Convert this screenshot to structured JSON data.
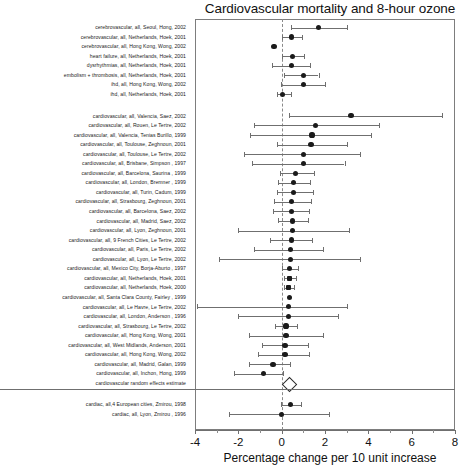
{
  "chart_data": {
    "type": "scatter",
    "title": "Cardiovascular mortality and 8-hour ozone",
    "xlabel": "Percentage change per 10 unit increase",
    "ylabel": "",
    "xlim": [
      -4,
      8
    ],
    "xticks": [
      -4,
      -2,
      0,
      2,
      4,
      6,
      8
    ],
    "xtick_labels": [
      "-4",
      "-2",
      "0",
      "2",
      "4",
      "6",
      "8"
    ],
    "grid": false,
    "reference_line": 0,
    "legend": "none",
    "annotations": [
      "Dashed vertical reference line at 0",
      "Open diamond marks the cardiovascular random effects estimate",
      "Horizontal lines are 95% confidence intervals with end caps"
    ],
    "groups": [
      {
        "name": "cerebrovascular / cardiac-specific outcomes",
        "rows": [
          {
            "label": "cerebrovascular, all, Seoul, Hong, 2002",
            "estimate": 1.7,
            "ci_low": 0.45,
            "ci_high": 3.0,
            "marker": "circle"
          },
          {
            "label": "cerebrovascular, all, Netherlands, Hoek, 2001",
            "estimate": 0.45,
            "ci_low": 0.0,
            "ci_high": 0.95,
            "marker": "circle"
          },
          {
            "label": "cerebrovascular, all, Hong Kong, Wong, 2002",
            "estimate": -0.35,
            "ci_low": -0.35,
            "ci_high": -0.35,
            "marker": "circle"
          },
          {
            "label": "heart failure, all, Netherlands, Hoek, 2001",
            "estimate": 0.5,
            "ci_low": 0.0,
            "ci_high": 1.05,
            "marker": "circle"
          },
          {
            "label": "dysrhythmias, all, Netherlands, Hoek, 2001",
            "estimate": 0.45,
            "ci_low": -0.45,
            "ci_high": 1.3,
            "marker": "circle"
          },
          {
            "label": "embolism + thrombosis, all, Netherlands, Hoek, 2001",
            "estimate": 1.0,
            "ci_low": 0.1,
            "ci_high": 1.7,
            "marker": "circle"
          },
          {
            "label": "ihd, all, Hong Kong, Wong, 2002",
            "estimate": 1.0,
            "ci_low": -0.05,
            "ci_high": 2.0,
            "marker": "circle"
          },
          {
            "label": "ihd, all, Netherlands, Hoek, 2001",
            "estimate": 0.05,
            "ci_low": -0.2,
            "ci_high": 0.45,
            "marker": "circle"
          }
        ]
      },
      {
        "name": "cardiovascular, all",
        "rows": [
          {
            "label": "cardiovascular, all, Valencia, Saez, 2002",
            "estimate": 3.2,
            "ci_low": 0.35,
            "ci_high": 7.4,
            "marker": "circle"
          },
          {
            "label": "cardiovascular, all, Rouen, Le Tertre, 2002",
            "estimate": 1.55,
            "ci_low": -1.3,
            "ci_high": 4.5,
            "marker": "circle"
          },
          {
            "label": "cardiovascular, all, Valencia, Tenias Burillo, 1999",
            "estimate": 1.4,
            "ci_low": -1.45,
            "ci_high": 4.1,
            "marker": "circle"
          },
          {
            "label": "cardiovascular, all, Toulouse, Zeghnoun, 2001",
            "estimate": 1.35,
            "ci_low": -0.2,
            "ci_high": 3.0,
            "marker": "circle"
          },
          {
            "label": "cardiovascular, all, Toulouse, Le Tertre, 2002",
            "estimate": 1.0,
            "ci_low": -1.75,
            "ci_high": 3.6,
            "marker": "circle"
          },
          {
            "label": "cardiovascular, all, Brisbane, Simpson , 1997",
            "estimate": 1.0,
            "ci_low": -1.35,
            "ci_high": 2.9,
            "marker": "circle"
          },
          {
            "label": "cardiovascular, all, Barcelona, Saurina , 1999",
            "estimate": 0.65,
            "ci_low": -0.1,
            "ci_high": 1.5,
            "marker": "circle"
          },
          {
            "label": "cardiovascular, all, London, Bremner , 1999",
            "estimate": 0.55,
            "ci_low": -0.15,
            "ci_high": 1.3,
            "marker": "circle"
          },
          {
            "label": "cardiovascular, all, Turin, Cadum, 1999",
            "estimate": 0.55,
            "ci_low": -0.2,
            "ci_high": 1.45,
            "marker": "circle"
          },
          {
            "label": "cardiovascular, all, Strasbourg, Zeghnoun, 2001",
            "estimate": 0.45,
            "ci_low": -0.35,
            "ci_high": 1.35,
            "marker": "circle"
          },
          {
            "label": "cardiovascular, all, Barcelona, Saez, 2002",
            "estimate": 0.45,
            "ci_low": -0.4,
            "ci_high": 1.25,
            "marker": "circle"
          },
          {
            "label": "cardiovascular, all, Madrid, Saez, 2002",
            "estimate": 0.5,
            "ci_low": -0.15,
            "ci_high": 1.2,
            "marker": "circle"
          },
          {
            "label": "cardiovascular, all, Lyon, Zeghnoun, 2001",
            "estimate": 0.5,
            "ci_low": -2.0,
            "ci_high": 3.1,
            "marker": "circle"
          },
          {
            "label": "cardiovascular, all, 9 French Cities, Le Tertre, 2002",
            "estimate": 0.45,
            "ci_low": -0.55,
            "ci_high": 1.4,
            "marker": "circle"
          },
          {
            "label": "cardiovascular, all, Paris, Le Tertre, 2002",
            "estimate": 0.4,
            "ci_low": -1.3,
            "ci_high": 1.9,
            "marker": "circle"
          },
          {
            "label": "cardiovascular, all, Lyon, Le Tertre, 2002",
            "estimate": 0.4,
            "ci_low": -2.9,
            "ci_high": 3.6,
            "marker": "circle"
          },
          {
            "label": "cardiovascular, all, Mexico City, Borja-Aburto , 1997",
            "estimate": 0.35,
            "ci_low": 0.0,
            "ci_high": 0.75,
            "marker": "circle"
          },
          {
            "label": "cardiovascular, all, Netherlands, Hoek, 2001",
            "estimate": 0.35,
            "ci_low": 0.1,
            "ci_high": 0.65,
            "marker": "square"
          },
          {
            "label": "cardiovascular, all, Netherlands, Hoek, 2000",
            "estimate": 0.3,
            "ci_low": 0.1,
            "ci_high": 0.55,
            "marker": "square"
          },
          {
            "label": "cardiovascular, all, Santa Clara County, Fairley , 1999",
            "estimate": 0.35,
            "ci_low": 0.35,
            "ci_high": 0.35,
            "marker": "circle"
          },
          {
            "label": "cardiovascular, all, Le Havre, Le Tertre, 2002",
            "estimate": 0.3,
            "ci_low": -3.9,
            "ci_high": 3.0,
            "marker": "circle"
          },
          {
            "label": "cardiovascular, all, London, Anderson , 1996",
            "estimate": 0.3,
            "ci_low": -2.0,
            "ci_high": 2.6,
            "marker": "circle"
          },
          {
            "label": "cardiovascular, all, Strasbourg, Le Tertre, 2002",
            "estimate": 0.2,
            "ci_low": -0.3,
            "ci_high": 0.7,
            "marker": "circle"
          },
          {
            "label": "cardiovascular, all, Hong Kong, Wong, 2001",
            "estimate": 0.2,
            "ci_low": -1.5,
            "ci_high": 1.9,
            "marker": "circle"
          },
          {
            "label": "cardiovascular, all, West Midlands, Anderson, 2001",
            "estimate": 0.15,
            "ci_low": -0.9,
            "ci_high": 1.2,
            "marker": "circle"
          },
          {
            "label": "cardiovascular, all, Hong Kong, Wong, 2002",
            "estimate": 0.15,
            "ci_low": -1.1,
            "ci_high": 1.25,
            "marker": "circle"
          },
          {
            "label": "cardiovascular, all, Madrid, Galan, 1999",
            "estimate": -0.4,
            "ci_low": -1.5,
            "ci_high": 0.4,
            "marker": "circle"
          },
          {
            "label": "cardiovascular, all, Inchon, Hong, 1999",
            "estimate": -0.85,
            "ci_low": -2.2,
            "ci_high": 0.05,
            "marker": "circle"
          },
          {
            "label": "cardiovascular random effects estimate",
            "estimate": 0.3,
            "ci_low": -0.1,
            "ci_high": 0.7,
            "marker": "diamond"
          }
        ]
      },
      {
        "name": "cardiac",
        "rows": [
          {
            "label": "cardiac, all,4 European cities, Zmirou, 1998",
            "estimate": 0.4,
            "ci_low": -0.05,
            "ci_high": 0.9,
            "marker": "circle"
          },
          {
            "label": "cardiac, all, Lyon, Zmirou , 1996",
            "estimate": 0.0,
            "ci_low": -2.45,
            "ci_high": 2.2,
            "marker": "circle"
          }
        ]
      }
    ]
  }
}
